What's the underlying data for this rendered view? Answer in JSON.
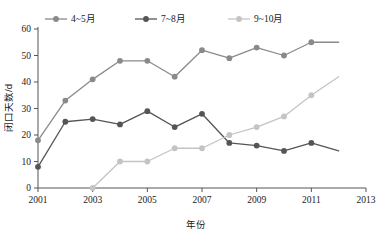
{
  "chart_data": {
    "type": "line",
    "title": "",
    "xlabel": "年份",
    "ylabel": "闭口天数/d",
    "xlim": [
      2001,
      2013
    ],
    "ylim": [
      0,
      60
    ],
    "x_ticks": [
      "2001",
      "2003",
      "2005",
      "2007",
      "2009",
      "2011",
      "2013"
    ],
    "y_ticks": [
      "0",
      "10",
      "20",
      "30",
      "40",
      "50",
      "60"
    ],
    "grid": false,
    "legend_position": "top",
    "x": [
      2001,
      2002,
      2003,
      2004,
      2005,
      2006,
      2007,
      2008,
      2009,
      2010,
      2011,
      2012
    ],
    "series": [
      {
        "name": "4~5月",
        "color": "#8a8a8a",
        "marker": "circle",
        "values": [
          18,
          33,
          41,
          48,
          48,
          42,
          52,
          49,
          53,
          50,
          55,
          55
        ]
      },
      {
        "name": "7~8月",
        "color": "#555555",
        "marker": "circle",
        "values": [
          8,
          25,
          26,
          24,
          29,
          23,
          28,
          17,
          16,
          14,
          17,
          14
        ]
      },
      {
        "name": "9~10月",
        "color": "#c4c4c4",
        "marker": "circle",
        "values": [
          null,
          null,
          0,
          10,
          10,
          15,
          15,
          20,
          23,
          27,
          35,
          42
        ]
      }
    ]
  },
  "legend": {
    "items": [
      {
        "label": "4~5月"
      },
      {
        "label": "7~8月"
      },
      {
        "label": "9~10月"
      }
    ]
  },
  "axes": {
    "y_title": "闭口天数/d",
    "x_title": "年份"
  }
}
